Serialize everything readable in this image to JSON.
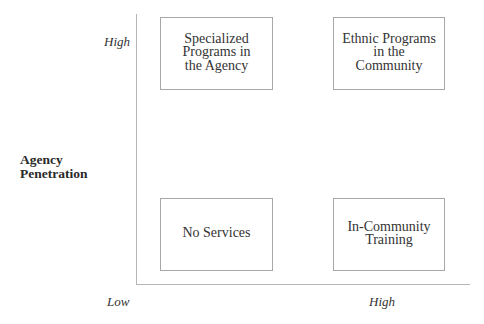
{
  "diagram": {
    "type": "2x2-matrix",
    "y_axis": {
      "label": "Agency\nPenetration",
      "high_label": "High"
    },
    "x_axis": {
      "label": "",
      "low_label": "Low",
      "high_label": "High"
    },
    "quadrants": {
      "top_left": "Specialized\nPrograms in\nthe Agency",
      "top_right": "Ethnic Programs\nin the\nCommunity",
      "bottom_left": "No Services",
      "bottom_right": "In-Community\nTraining"
    },
    "colors": {
      "axis": "#b5b5b5",
      "box_border": "#a8a8a8",
      "text": "#333333",
      "background": "#ffffff"
    }
  }
}
